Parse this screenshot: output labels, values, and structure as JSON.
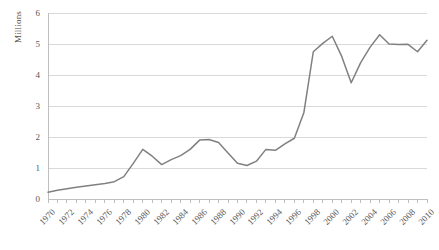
{
  "chart_data": {
    "type": "line",
    "title": "",
    "subtitle": "",
    "xlabel": "",
    "ylabel": "Millions",
    "ylim": [
      0,
      6
    ],
    "xlim": [
      1970,
      2010
    ],
    "grid": true,
    "legend": false,
    "legend_position": "none",
    "y_ticks": [
      0,
      1,
      2,
      3,
      4,
      5,
      6
    ],
    "y_tick_labels": [
      "0",
      "1",
      "2",
      "3",
      "4",
      "5",
      "6"
    ],
    "x_tick_labels": [
      "1970",
      "1972",
      "1974",
      "1976",
      "1978",
      "1980",
      "1982",
      "1984",
      "1986",
      "1988",
      "1990",
      "1992",
      "1994",
      "1996",
      "1998",
      "2000",
      "2002",
      "2004",
      "2006",
      "2008",
      "2010"
    ],
    "x": [
      1970,
      1971,
      1972,
      1973,
      1974,
      1975,
      1976,
      1977,
      1978,
      1979,
      1980,
      1981,
      1982,
      1983,
      1984,
      1985,
      1986,
      1987,
      1988,
      1989,
      1990,
      1991,
      1992,
      1993,
      1994,
      1995,
      1996,
      1997,
      1998,
      1999,
      2000,
      2001,
      2002,
      2003,
      2004,
      2005,
      2006,
      2007,
      2008,
      2009,
      2010
    ],
    "values": [
      0.22,
      0.28,
      0.33,
      0.38,
      0.42,
      0.46,
      0.5,
      0.56,
      0.72,
      1.15,
      1.6,
      1.38,
      1.11,
      1.27,
      1.4,
      1.6,
      1.9,
      1.92,
      1.82,
      1.48,
      1.15,
      1.08,
      1.22,
      1.6,
      1.57,
      1.78,
      1.96,
      2.78,
      4.75,
      5.02,
      5.25,
      4.6,
      3.75,
      4.4,
      4.9,
      5.3,
      5.0,
      4.98,
      4.99,
      4.75,
      5.12
    ],
    "series_name": "",
    "line_color": "#808080",
    "grid_color": "#d9d9d9",
    "axis_color": "#bfbfbf",
    "background": "#ffffff"
  },
  "layout": {
    "plot_left": 48,
    "plot_right": 427,
    "plot_top": 13,
    "plot_bottom": 199
  }
}
